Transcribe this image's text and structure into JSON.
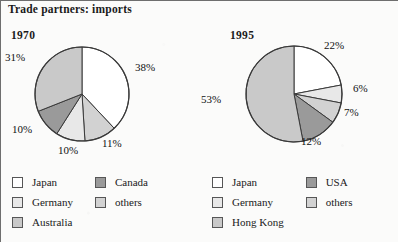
{
  "title": "Trade partners: imports",
  "colors": {
    "japan": "#ffffff",
    "germany": "#e8e8e8",
    "others": "#d2d2d2",
    "australia": "#c9c9c9",
    "hong_kong": "#c9c9c9",
    "canada": "#9a9a9a",
    "usa": "#9a9a9a",
    "outline": "#3a3a3a",
    "text": "#111111",
    "background": "#fbfbfa"
  },
  "panels": [
    {
      "year": "1970",
      "labels": [
        {
          "text": "38%",
          "x": 134,
          "y": 60
        },
        {
          "text": "11%",
          "x": 101,
          "y": 136
        },
        {
          "text": "10%",
          "x": 57,
          "y": 143
        },
        {
          "text": "10%",
          "x": 11,
          "y": 122
        },
        {
          "text": "31%",
          "x": 4,
          "y": 50
        }
      ],
      "legend": [
        {
          "label": "Japan",
          "color": "#ffffff"
        },
        {
          "label": "Germany",
          "color": "#e8e8e8"
        },
        {
          "label": "Australia",
          "color": "#c9c9c9"
        },
        {
          "label": "Canada",
          "color": "#9a9a9a"
        },
        {
          "label": "others",
          "color": "#d2d2d2"
        }
      ]
    },
    {
      "year": "1995",
      "labels": [
        {
          "text": "22%",
          "x": 124,
          "y": 38
        },
        {
          "text": "6%",
          "x": 153,
          "y": 81
        },
        {
          "text": "7%",
          "x": 144,
          "y": 105
        },
        {
          "text": "12%",
          "x": 101,
          "y": 134
        },
        {
          "text": "53%",
          "x": 1,
          "y": 92
        }
      ],
      "legend": [
        {
          "label": "Japan",
          "color": "#ffffff"
        },
        {
          "label": "Germany",
          "color": "#e8e8e8"
        },
        {
          "label": "Hong Kong",
          "color": "#c9c9c9"
        },
        {
          "label": "USA",
          "color": "#9a9a9a"
        },
        {
          "label": "others",
          "color": "#d2d2d2"
        }
      ]
    }
  ],
  "chart_data": [
    {
      "type": "pie",
      "title": "1970",
      "categories": [
        "Japan",
        "Canada",
        "others",
        "Germany",
        "Australia"
      ],
      "values": [
        38,
        11,
        10,
        10,
        31
      ],
      "labels": [
        "38%",
        "11%",
        "10%",
        "10%",
        "31%"
      ],
      "colors": [
        "#ffffff",
        "#d2d2d2",
        "#e8e8e8",
        "#9a9a9a",
        "#c9c9c9"
      ],
      "units": "percent",
      "start_angle_deg": 0,
      "direction": "clockwise",
      "legend": [
        "Japan",
        "Germany",
        "Australia",
        "Canada",
        "others"
      ],
      "legend_position": "bottom"
    },
    {
      "type": "pie",
      "title": "1995",
      "categories": [
        "Japan",
        "Germany",
        "others",
        "USA",
        "Hong Kong"
      ],
      "values": [
        22,
        6,
        7,
        12,
        53
      ],
      "labels": [
        "22%",
        "6%",
        "7%",
        "12%",
        "53%"
      ],
      "colors": [
        "#ffffff",
        "#e8e8e8",
        "#d2d2d2",
        "#9a9a9a",
        "#c9c9c9"
      ],
      "units": "percent",
      "start_angle_deg": 0,
      "direction": "clockwise",
      "legend": [
        "Japan",
        "Germany",
        "Hong Kong",
        "USA",
        "others"
      ],
      "legend_position": "bottom"
    }
  ]
}
